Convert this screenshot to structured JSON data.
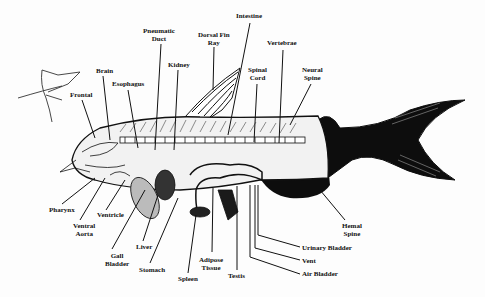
{
  "diagram": {
    "labels": [
      {
        "id": "intestine",
        "text": "Intestine",
        "x": 243,
        "y": 14
      },
      {
        "id": "pneumatic-duct",
        "text": "Pneumatic\nDuct",
        "x": 145,
        "y": 29
      },
      {
        "id": "dorsal-fin-ray",
        "text": "Dorsal Fin\nRay",
        "x": 199,
        "y": 32
      },
      {
        "id": "vertebrae",
        "text": "Vertebrae",
        "x": 267,
        "y": 40
      },
      {
        "id": "kidney",
        "text": "Kidney",
        "x": 168,
        "y": 62
      },
      {
        "id": "brain",
        "text": "Brain",
        "x": 96,
        "y": 68
      },
      {
        "id": "spinal-cord",
        "text": "Spinal\nCord",
        "x": 248,
        "y": 67
      },
      {
        "id": "neural-spine",
        "text": "Neural\nSpine",
        "x": 302,
        "y": 67
      },
      {
        "id": "esophagus",
        "text": "Esophagus",
        "x": 113,
        "y": 81
      },
      {
        "id": "frontal",
        "text": "Frontal",
        "x": 71,
        "y": 91
      },
      {
        "id": "pharynx",
        "text": "Pharynx",
        "x": 49,
        "y": 207
      },
      {
        "id": "ventricle",
        "text": "Ventricle",
        "x": 97,
        "y": 212
      },
      {
        "id": "ventral-aorta",
        "text": "Ventral\nAorta",
        "x": 73,
        "y": 222
      },
      {
        "id": "liver",
        "text": "Liver",
        "x": 136,
        "y": 244
      },
      {
        "id": "gall-bladder",
        "text": "Gall\nBladder",
        "x": 105,
        "y": 252
      },
      {
        "id": "stomach",
        "text": "Stomach",
        "x": 139,
        "y": 266
      },
      {
        "id": "adipose-tissue",
        "text": "Adipose\nTissue",
        "x": 198,
        "y": 256
      },
      {
        "id": "spleen",
        "text": "Spleen",
        "x": 178,
        "y": 275
      },
      {
        "id": "testis",
        "text": "Testis",
        "x": 228,
        "y": 272
      },
      {
        "id": "hemal-spine",
        "text": "Hemal\nSpine",
        "x": 342,
        "y": 222
      },
      {
        "id": "urinary-bladder",
        "text": "Urinary Bladder",
        "x": 302,
        "y": 244
      },
      {
        "id": "vent",
        "text": "Vent",
        "x": 302,
        "y": 257
      },
      {
        "id": "air-bladder",
        "text": "Air Bladder",
        "x": 302,
        "y": 271
      }
    ],
    "colors": {
      "ink": "#111111",
      "paper": "#fdfdfd",
      "body_fill": "#f2f2f2",
      "tail_fill": "#0d0d0d"
    }
  }
}
